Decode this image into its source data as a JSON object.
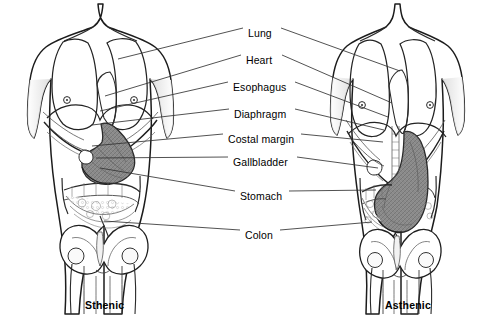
{
  "figure": {
    "background_color": "#ffffff",
    "line_color": "#1a1a1a",
    "organ_shade_color": "#808080",
    "leader_color": "#333333"
  },
  "labels": [
    {
      "id": "lung",
      "text": "Lung",
      "x": 248,
      "y": 28,
      "w": 30
    },
    {
      "id": "heart",
      "text": "Heart",
      "x": 246,
      "y": 55,
      "w": 33
    },
    {
      "id": "esophagus",
      "text": "Esophagus",
      "x": 233,
      "y": 82,
      "w": 59
    },
    {
      "id": "diaphragm",
      "text": "Diaphragm",
      "x": 234,
      "y": 109,
      "w": 58
    },
    {
      "id": "costal-margin",
      "text": "Costal margin",
      "x": 228,
      "y": 134,
      "w": 70
    },
    {
      "id": "gallbladder",
      "text": "Gallbladder",
      "x": 233,
      "y": 157,
      "w": 62
    },
    {
      "id": "stomach",
      "text": "Stomach",
      "x": 240,
      "y": 191,
      "w": 46
    },
    {
      "id": "colon",
      "text": "Colon",
      "x": 245,
      "y": 230,
      "w": 32
    }
  ],
  "captions": [
    {
      "id": "sthenic",
      "text": "Sthenic",
      "x": 85,
      "y": 299
    },
    {
      "id": "asthenic",
      "text": "Asthenic",
      "x": 385,
      "y": 299
    }
  ],
  "figures": [
    {
      "id": "sthenic-figure",
      "caption": "Sthenic",
      "side": "left",
      "description": "Broad, stocky torso; transverse high-lying J-shaped stomach sitting in the upper abdomen"
    },
    {
      "id": "asthenic-figure",
      "caption": "Asthenic",
      "side": "right",
      "description": "Narrow, slender torso; long vertical elongated stomach descending into the pelvis"
    }
  ],
  "leaders": {
    "left": [
      {
        "label": "lung",
        "x1": 243,
        "y1": 28,
        "x2": 118,
        "y2": 59
      },
      {
        "label": "heart",
        "x1": 241,
        "y1": 55,
        "x2": 105,
        "y2": 96
      },
      {
        "label": "esophagus",
        "x1": 228,
        "y1": 82,
        "x2": 100,
        "y2": 111
      },
      {
        "label": "diaphragm",
        "x1": 229,
        "y1": 109,
        "x2": 92,
        "y2": 125
      },
      {
        "label": "costal-margin",
        "x1": 223,
        "y1": 134,
        "x2": 92,
        "y2": 146
      },
      {
        "label": "gallbladder",
        "x1": 228,
        "y1": 157,
        "x2": 96,
        "y2": 158
      },
      {
        "label": "stomach",
        "x1": 235,
        "y1": 191,
        "x2": 100,
        "y2": 168
      },
      {
        "label": "colon",
        "x1": 240,
        "y1": 230,
        "x2": 104,
        "y2": 221
      }
    ],
    "right": [
      {
        "label": "lung",
        "x1": 281,
        "y1": 28,
        "x2": 400,
        "y2": 71
      },
      {
        "label": "heart",
        "x1": 282,
        "y1": 55,
        "x2": 392,
        "y2": 103
      },
      {
        "label": "esophagus",
        "x1": 295,
        "y1": 82,
        "x2": 388,
        "y2": 117
      },
      {
        "label": "diaphragm",
        "x1": 295,
        "y1": 109,
        "x2": 384,
        "y2": 130
      },
      {
        "label": "costal-margin",
        "x1": 301,
        "y1": 134,
        "x2": 383,
        "y2": 142
      },
      {
        "label": "gallbladder",
        "x1": 297,
        "y1": 157,
        "x2": 378,
        "y2": 168
      },
      {
        "label": "stomach",
        "x1": 289,
        "y1": 191,
        "x2": 376,
        "y2": 190
      },
      {
        "label": "colon",
        "x1": 280,
        "y1": 230,
        "x2": 372,
        "y2": 222
      }
    ]
  }
}
